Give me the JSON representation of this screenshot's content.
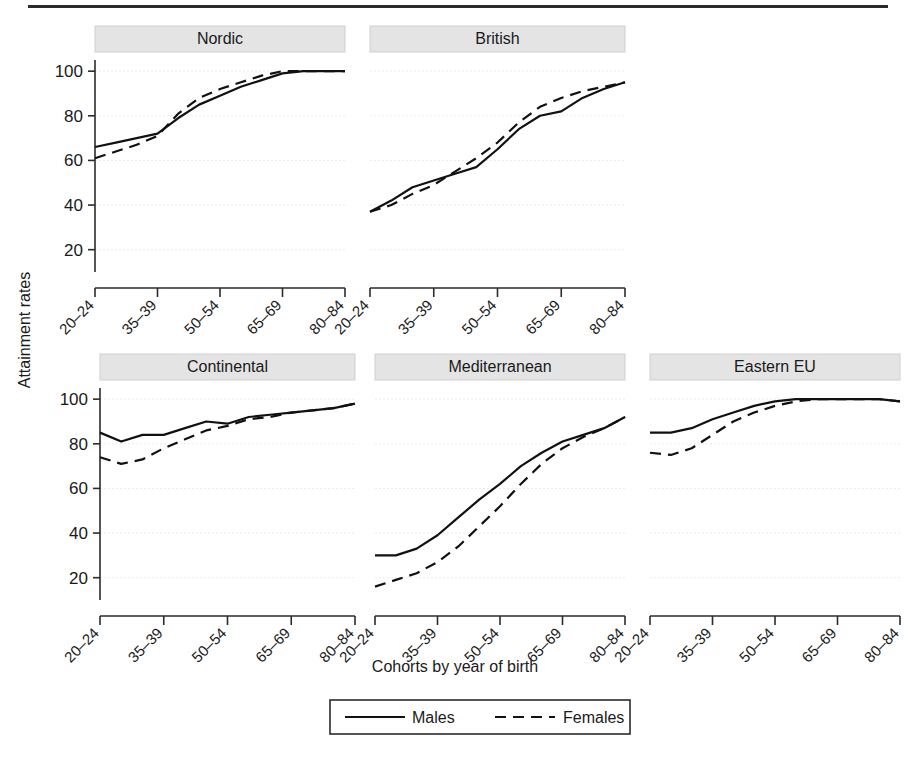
{
  "figure": {
    "ylabel": "Attainment rates",
    "xlabel": "Cohorts by year of birth",
    "legend": {
      "males": "Males",
      "females": "Females"
    }
  },
  "chart_data": {
    "type": "line",
    "title": "",
    "xlabel": "Cohorts by year of birth",
    "ylabel": "Attainment rates",
    "ylim": [
      10,
      105
    ],
    "yticks": [
      20,
      40,
      60,
      80,
      100
    ],
    "grid": true,
    "legend_position": "bottom",
    "legend_entries": [
      "Males",
      "Females"
    ],
    "x": [
      "20-24",
      "25-29",
      "30-34",
      "35-39",
      "40-44",
      "45-49",
      "50-54",
      "55-59",
      "60-64",
      "65-69",
      "70-74",
      "75-79",
      "80-84"
    ],
    "xtick_labels": [
      "20–24",
      "35–39",
      "50–54",
      "65–69",
      "80–84"
    ],
    "xtick_indices": [
      0,
      3,
      6,
      9,
      12
    ],
    "panels": [
      {
        "name": "Nordic",
        "row": 0,
        "col": 0,
        "series": [
          {
            "name": "Males",
            "style": "solid",
            "values": [
              66,
              68,
              70,
              72,
              79,
              85,
              89,
              93,
              96,
              99,
              100,
              100,
              100
            ]
          },
          {
            "name": "Females",
            "style": "dashed",
            "values": [
              61,
              64,
              67,
              71,
              81,
              88,
              92,
              95,
              98,
              100,
              100,
              100,
              100
            ]
          }
        ]
      },
      {
        "name": "British",
        "row": 0,
        "col": 1,
        "series": [
          {
            "name": "Males",
            "style": "solid",
            "values": [
              37,
              42,
              48,
              51,
              54,
              57,
              65,
              74,
              80,
              82,
              88,
              92,
              95
            ]
          },
          {
            "name": "Females",
            "style": "dashed",
            "values": [
              37,
              40,
              45,
              49,
              55,
              61,
              68,
              77,
              84,
              88,
              91,
              93,
              95
            ]
          }
        ]
      },
      {
        "name": "Continental",
        "row": 1,
        "col": 0,
        "series": [
          {
            "name": "Males",
            "style": "solid",
            "values": [
              85,
              81,
              84,
              84,
              87,
              90,
              89,
              92,
              93,
              94,
              95,
              96,
              98
            ]
          },
          {
            "name": "Females",
            "style": "dashed",
            "values": [
              74,
              71,
              73,
              78,
              82,
              86,
              88,
              91,
              92,
              94,
              95,
              96,
              98
            ]
          }
        ]
      },
      {
        "name": "Mediterranean",
        "row": 1,
        "col": 1,
        "series": [
          {
            "name": "Males",
            "style": "solid",
            "values": [
              30,
              30,
              33,
              39,
              47,
              55,
              62,
              70,
              76,
              81,
              84,
              87,
              92
            ]
          },
          {
            "name": "Females",
            "style": "dashed",
            "values": [
              16,
              19,
              22,
              27,
              34,
              43,
              52,
              62,
              71,
              78,
              83,
              87,
              92
            ]
          }
        ]
      },
      {
        "name": "Eastern EU",
        "row": 1,
        "col": 2,
        "series": [
          {
            "name": "Males",
            "style": "solid",
            "values": [
              85,
              85,
              87,
              91,
              94,
              97,
              99,
              100,
              100,
              100,
              100,
              100,
              99
            ]
          },
          {
            "name": "Females",
            "style": "dashed",
            "values": [
              76,
              75,
              78,
              84,
              90,
              94,
              97,
              99,
              100,
              100,
              100,
              100,
              99
            ]
          }
        ]
      }
    ]
  }
}
